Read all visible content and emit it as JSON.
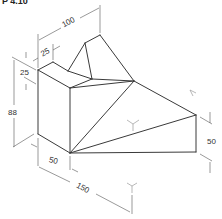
{
  "title_fragment": "P 4.10",
  "drawing": {
    "type": "isometric-dimensioned-drawing",
    "dimensions": {
      "top_length": "100",
      "notch_width": "25",
      "notch_depth": "25",
      "total_height": "88",
      "front_width": "50",
      "base_length": "150",
      "right_height": "50"
    }
  }
}
